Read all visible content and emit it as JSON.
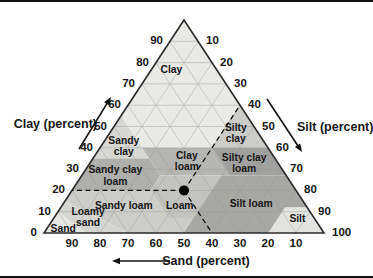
{
  "figure": {
    "kind": "USDA soil texture triangle",
    "background": "#ffffff",
    "frame_rule_color": "#111111",
    "text_color": "#161616",
    "outline_color": "#2b2b2b",
    "grid_color": "#999999"
  },
  "chart_data": {
    "type": "scatter",
    "variant": "ternary",
    "title": "",
    "grid": {
      "on": true,
      "step": 10
    },
    "axes": {
      "clay": {
        "label": "Clay (percent)",
        "ticks": [
          0,
          10,
          20,
          30,
          40,
          50,
          60,
          70,
          80,
          90
        ],
        "arrow_direction": "up-right"
      },
      "silt": {
        "label": "Silt (percent)",
        "ticks": [
          10,
          20,
          30,
          40,
          50,
          60,
          70,
          80,
          90,
          100
        ],
        "arrow_direction": "down-right"
      },
      "sand": {
        "label": "Sand (percent)",
        "ticks": [
          90,
          80,
          70,
          60,
          50,
          40,
          30,
          20,
          10
        ],
        "arrow_direction": "left"
      }
    },
    "regions": [
      {
        "id": "clay",
        "label": [
          "Clay"
        ],
        "fill": "#e9e9e6",
        "label_at": [
          77,
          16
        ],
        "polygon": [
          [
            55,
            45
          ],
          [
            100,
            0
          ],
          [
            60,
            0
          ],
          [
            40,
            20
          ],
          [
            40,
            45
          ]
        ]
      },
      {
        "id": "silty-clay",
        "label": [
          "Silty",
          "clay"
        ],
        "fill": "#ccccc9",
        "label_at": [
          47,
          8
        ],
        "polygon": [
          [
            60,
            0
          ],
          [
            40,
            20
          ],
          [
            40,
            0
          ]
        ]
      },
      {
        "id": "sandy-clay",
        "label": [
          "Sandy",
          "clay"
        ],
        "fill": "#d7d7d4",
        "label_at": [
          41,
          51
        ],
        "polygon": [
          [
            55,
            45
          ],
          [
            35,
            65
          ],
          [
            35,
            45
          ]
        ]
      },
      {
        "id": "clay-loam",
        "label": [
          "Clay",
          "loam"
        ],
        "fill": "#b5b5b2",
        "label_at": [
          34,
          32
        ],
        "polygon": [
          [
            40,
            45
          ],
          [
            40,
            20
          ],
          [
            27,
            20
          ],
          [
            27,
            45
          ]
        ]
      },
      {
        "id": "silty-clay-loam",
        "label": [
          "Silty clay",
          "loam"
        ],
        "fill": "#a1a19f",
        "label_at": [
          33,
          12
        ],
        "polygon": [
          [
            40,
            20
          ],
          [
            40,
            0
          ],
          [
            27,
            0
          ],
          [
            27,
            20
          ]
        ]
      },
      {
        "id": "sandy-clay-loam",
        "label": [
          "Sandy clay",
          "loam"
        ],
        "fill": "#afafac",
        "label_at": [
          27,
          61
        ],
        "polygon": [
          [
            35,
            65
          ],
          [
            35,
            45
          ],
          [
            27,
            45
          ],
          [
            20,
            52
          ],
          [
            20,
            80
          ]
        ]
      },
      {
        "id": "loam",
        "label": [
          "Loam"
        ],
        "fill": "#c3c3c0",
        "label_at": [
          13,
          45
        ],
        "polygon": [
          [
            27,
            45
          ],
          [
            27,
            23
          ],
          [
            7,
            43
          ],
          [
            7,
            52
          ],
          [
            20,
            52
          ]
        ]
      },
      {
        "id": "sandy-loam",
        "label": [
          "Sandy loam"
        ],
        "fill": "#cdcdca",
        "label_at": [
          13,
          65
        ],
        "polygon": [
          [
            20,
            80
          ],
          [
            20,
            52
          ],
          [
            7,
            52
          ],
          [
            7,
            43
          ],
          [
            0,
            50
          ],
          [
            0,
            70
          ],
          [
            15,
            85
          ]
        ]
      },
      {
        "id": "silt-loam",
        "label": [
          "Silt loam"
        ],
        "fill": "#a7a7a4",
        "label_at": [
          14,
          19
        ],
        "polygon": [
          [
            27,
            23
          ],
          [
            27,
            0
          ],
          [
            12,
            0
          ],
          [
            12,
            8
          ],
          [
            0,
            20
          ],
          [
            0,
            50
          ],
          [
            7,
            43
          ]
        ]
      },
      {
        "id": "silt",
        "label": [
          "Silt"
        ],
        "fill": "#e3e3e0",
        "label_at": [
          7,
          6
        ],
        "polygon": [
          [
            12,
            8
          ],
          [
            12,
            0
          ],
          [
            0,
            0
          ],
          [
            0,
            20
          ]
        ]
      },
      {
        "id": "loamy-sand",
        "label": [
          "Loamy",
          "sand"
        ],
        "fill": "#d5d5d2",
        "label_at": [
          7.5,
          80.5
        ],
        "polygon": [
          [
            15,
            85
          ],
          [
            10,
            90
          ],
          [
            0,
            85
          ],
          [
            0,
            70
          ]
        ]
      },
      {
        "id": "sand",
        "label": [
          "Sand"
        ],
        "fill": "#e5e5e2",
        "label_at": [
          2.3,
          92
        ],
        "polygon": [
          [
            10,
            90
          ],
          [
            0,
            100
          ],
          [
            0,
            85
          ]
        ]
      }
    ],
    "points": [
      {
        "clay": 20,
        "sand": 40,
        "silt": 40,
        "color": "#000000",
        "radius": 5,
        "guides": true,
        "guide_style": "dashed",
        "falls_in_region": "Loam"
      }
    ]
  }
}
